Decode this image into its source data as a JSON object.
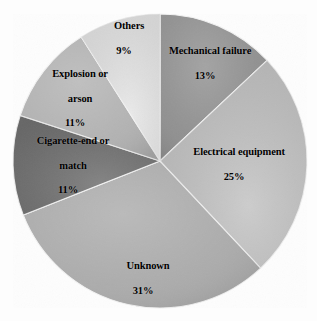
{
  "chart_data": {
    "type": "pie",
    "title": "",
    "subtitle": "",
    "xlabel": "",
    "ylabel": "",
    "legend_position": "none",
    "labels_position": "inside-slice",
    "grid": false,
    "units": "percent",
    "total": 100,
    "start_angle_deg": 0,
    "direction": "clockwise",
    "categories": [
      "Mechanical failure",
      "Electrical equipment",
      "Unknown",
      "Cigarette-end or match",
      "Explosion or arson",
      "Others"
    ],
    "values": [
      13,
      25,
      31,
      11,
      11,
      9
    ],
    "slices": [
      {
        "name": "Mechanical failure",
        "label_lines": [
          "Mechanical failure"
        ],
        "value": 13,
        "percent_text": "13%",
        "color": "#8d8d8d",
        "start_deg": 0,
        "end_deg": 46.8,
        "label_x": 205,
        "label_y": 70
      },
      {
        "name": "Electrical equipment",
        "label_lines": [
          "Electrical equipment"
        ],
        "value": 25,
        "percent_text": "25%",
        "color": "#c4c4c4",
        "start_deg": 46.8,
        "end_deg": 136.8,
        "label_x": 234,
        "label_y": 171
      },
      {
        "name": "Unknown",
        "label_lines": [
          "Unknown"
        ],
        "value": 31,
        "percent_text": "31%",
        "color": "#a9a9a9",
        "start_deg": 136.8,
        "end_deg": 248.4,
        "label_x": 143,
        "label_y": 285
      },
      {
        "name": "Cigarette-end or match",
        "label_lines": [
          "Cigarette-end or",
          "match"
        ],
        "value": 11,
        "percent_text": "11%",
        "color": "#717171",
        "start_deg": 248.4,
        "end_deg": 288.0,
        "label_x": 68,
        "label_y": 172
      },
      {
        "name": "Explosion or arson",
        "label_lines": [
          "Explosion or",
          "arson"
        ],
        "value": 11,
        "percent_text": "11%",
        "color": "#b0b0b0",
        "start_deg": 288.0,
        "end_deg": 327.6,
        "label_x": 75,
        "label_y": 105
      },
      {
        "name": "Others",
        "label_lines": [
          "Others"
        ],
        "value": 9,
        "percent_text": "9%",
        "color": "#e7e7e7",
        "start_deg": 327.6,
        "end_deg": 360.0,
        "label_x": 124,
        "label_y": 45
      }
    ],
    "geometry": {
      "center_x": 160,
      "center_y": 161,
      "radius": 147
    },
    "background_color": "#fdfdfd",
    "label_color": "#000000"
  }
}
